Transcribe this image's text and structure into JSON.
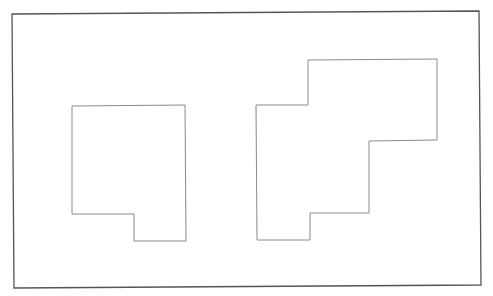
{
  "canvas": {
    "width": 493,
    "height": 296,
    "background": "#ffffff"
  },
  "frame": {
    "points": "12,14 479,11 481,285 14,288",
    "stroke": "#555555",
    "stroke_width": 1.3
  },
  "shapes": [
    {
      "name": "left-polygon",
      "points": "72,106 185,105 186,241 134,241 134,214 72,214",
      "stroke": "#8a8a8a",
      "stroke_width": 1
    },
    {
      "name": "right-polygon",
      "points": "256,105 308,105 308,60 437,59 437,140 369,141 369,213 310,213 310,240 257,240",
      "stroke": "#8a8a8a",
      "stroke_width": 1
    }
  ]
}
